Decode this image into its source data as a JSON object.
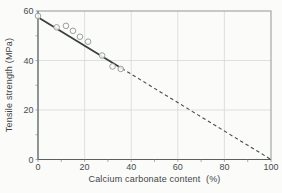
{
  "figure": {
    "background": "#fbfbfa"
  },
  "chart_data": {
    "type": "scatter",
    "title": "",
    "xlabel": "Calcium carbonate content  (%)",
    "ylabel": "Tensile strength (MPa)",
    "xlim": [
      0,
      100
    ],
    "ylim": [
      0,
      60
    ],
    "x_ticks": [
      0,
      20,
      40,
      60,
      80,
      100
    ],
    "y_ticks": [
      0,
      20,
      40,
      60
    ],
    "minor_tick_step": 10,
    "grid": true,
    "legend": null,
    "series": [
      {
        "name": "measured-tensile-strength",
        "type": "scatter",
        "marker": "open-circle",
        "points": [
          [
            0,
            58
          ],
          [
            8,
            53.4
          ],
          [
            12,
            54
          ],
          [
            15,
            52
          ],
          [
            18,
            49.6
          ],
          [
            21.5,
            47.6
          ],
          [
            27.5,
            42
          ],
          [
            32,
            37.6
          ],
          [
            35.5,
            36.6
          ]
        ]
      },
      {
        "name": "linear-extrapolation-to-100pct-filler",
        "type": "line",
        "points": [
          [
            0,
            57.5
          ],
          [
            100,
            0
          ]
        ],
        "solid_until_x": 36,
        "style": "solid through data, dashed extrapolation"
      }
    ],
    "colors": {
      "fit_line": "#3a3d3d",
      "dashed_line": "#4a4d4d",
      "marker_stroke": "#9aa0a0",
      "marker_fill": "#fbfbfa",
      "grid": "#d5d9d9",
      "axis": "#70777 7",
      "border": "#868d8d",
      "axis_dark": "#596060",
      "text": "#474c4c"
    }
  }
}
